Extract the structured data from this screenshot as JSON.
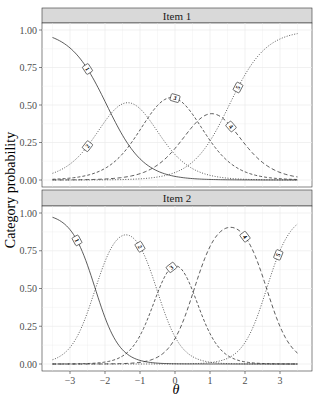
{
  "chart_data": {
    "type": "line",
    "title": "",
    "xlabel": "θ",
    "ylabel": "Category probability",
    "xlim": [
      -3.5,
      3.5
    ],
    "ylim": [
      0,
      1
    ],
    "x_ticks": [
      -3,
      -2,
      -1,
      0,
      1,
      2,
      3
    ],
    "x_tick_labels": [
      "−3",
      "−2",
      "−1",
      "0",
      "1",
      "2",
      "3"
    ],
    "y_ticks": [
      0,
      0.25,
      0.5,
      0.75,
      1
    ],
    "y_tick_labels": [
      "0.00",
      "0.25",
      "0.50",
      "0.75",
      "1.00"
    ],
    "grid": true,
    "legend": "none (direct curve labels 1–5)",
    "panels": [
      {
        "strip": "Item 1",
        "model": "graded response",
        "a": 1.9,
        "thresholds": [
          -1.95,
          -0.75,
          0.55,
          1.55
        ],
        "series": [
          {
            "name": "1",
            "style": "solid",
            "peak_theta": -3.5,
            "peak_p": 0.97,
            "label_theta": -2.5
          },
          {
            "name": "2",
            "style": "dotted",
            "peak_theta": -1.35,
            "peak_p": 0.64,
            "label_theta": -2.5
          },
          {
            "name": "3",
            "style": "dashed",
            "peak_theta": -0.15,
            "peak_p": 0.66,
            "label_theta": 0.0
          },
          {
            "name": "4",
            "style": "longdash",
            "peak_theta": 1.0,
            "peak_p": 0.45,
            "label_theta": 1.6
          },
          {
            "name": "5",
            "style": "dotted",
            "peak_theta": 3.5,
            "peak_p": 0.99,
            "label_theta": 1.8
          }
        ]
      },
      {
        "strip": "Item 2",
        "model": "graded response",
        "a": 2.9,
        "thresholds": [
          -2.28,
          -0.52,
          0.55,
          2.62
        ],
        "series": [
          {
            "name": "1",
            "style": "solid",
            "peak_theta": -3.5,
            "peak_p": 0.98,
            "label_theta": -2.8
          },
          {
            "name": "2",
            "style": "dotted",
            "peak_theta": -1.4,
            "peak_p": 0.87,
            "label_theta": -1.0
          },
          {
            "name": "3",
            "style": "dashed",
            "peak_theta": -0.05,
            "peak_p": 0.73,
            "label_theta": -0.1
          },
          {
            "name": "4",
            "style": "longdash",
            "peak_theta": 1.55,
            "peak_p": 0.93,
            "label_theta": 2.0
          },
          {
            "name": "5",
            "style": "dotted",
            "peak_theta": 3.5,
            "peak_p": 0.97,
            "label_theta": 2.95
          }
        ]
      }
    ]
  },
  "labels": {
    "ylabel": "Category probability",
    "xlabel": "θ",
    "strip1": "Item 1",
    "strip2": "Item 2"
  }
}
